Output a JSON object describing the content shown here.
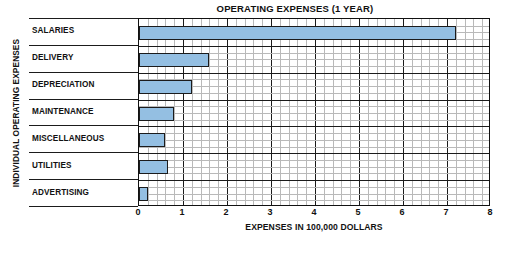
{
  "chart_data": {
    "type": "bar",
    "orientation": "horizontal",
    "title": "OPERATING EXPENSES (1 YEAR)",
    "xlabel": "EXPENSES IN 100,000 DOLLARS",
    "ylabel": "INDIVIDUAL OPERATING EXPENSES",
    "categories": [
      "SALARIES",
      "DELIVERY",
      "DEPRECIATION",
      "MAINTENANCE",
      "MISCELLANEOUS",
      "UTILITIES",
      "ADVERTISING"
    ],
    "values": [
      7.2,
      1.6,
      1.2,
      0.8,
      0.6,
      0.65,
      0.2
    ],
    "xlim": [
      0,
      8
    ],
    "xticks": [
      0,
      1,
      2,
      3,
      4,
      5,
      6,
      7,
      8
    ],
    "xtick_labels": [
      "0",
      "1",
      "2",
      "3",
      "4",
      "5",
      "6",
      "7",
      "8"
    ],
    "x_minor_step": 0.2,
    "grid": "both",
    "legend": "none",
    "bar_color": "#94bfe2",
    "bar_edge_color": "#1b1b1b",
    "grid_minor_color": "#b9b9b9",
    "grid_major_color": "#1b1b1b",
    "background": "#ffffff"
  }
}
